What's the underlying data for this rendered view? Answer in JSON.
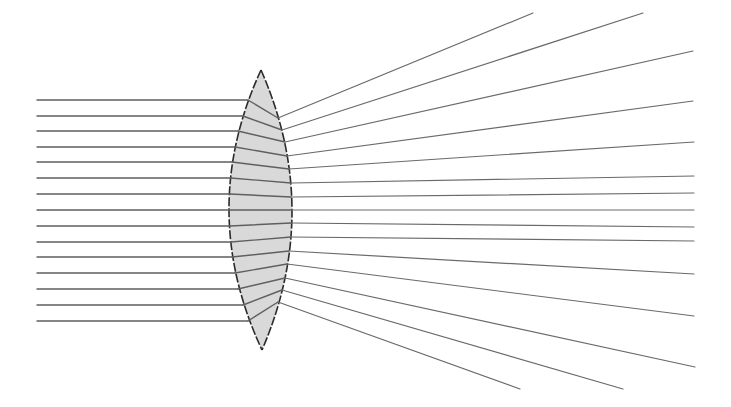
{
  "diagram": {
    "title": "Parallel rays refracted by a biconvex lens showing spherical aberration",
    "colors": {
      "background": "#ffffff",
      "ray": "#5f5f5f",
      "lens_fill": "#d9d9d9",
      "lens_outline": "#2b2b2b"
    },
    "lens": {
      "top_vertex": [
        261,
        70
      ],
      "bottom_vertex": [
        262,
        350
      ],
      "left_surface_apex_x": 229,
      "right_surface_apex_x": 292
    },
    "focus": [
      398,
      210
    ],
    "incoming_ray_start_x": 37,
    "rays": [
      {
        "y": 100,
        "enter_x": 248,
        "exit": [
          278,
          118
        ],
        "end": [
          533,
          13
        ]
      },
      {
        "y": 116,
        "enter_x": 243,
        "exit": [
          282,
          130
        ],
        "end": [
          643,
          13
        ]
      },
      {
        "y": 131,
        "enter_x": 238,
        "exit": [
          285,
          142
        ],
        "end": [
          693,
          51
        ]
      },
      {
        "y": 147,
        "enter_x": 235,
        "exit": [
          287,
          156
        ],
        "end": [
          693,
          101
        ]
      },
      {
        "y": 162,
        "enter_x": 232,
        "exit": [
          289,
          169
        ],
        "end": [
          694,
          142
        ]
      },
      {
        "y": 178,
        "enter_x": 231,
        "exit": [
          291,
          183
        ],
        "end": [
          694,
          176
        ]
      },
      {
        "y": 194,
        "enter_x": 230,
        "exit": [
          291,
          197
        ],
        "end": [
          694,
          193
        ]
      },
      {
        "y": 210,
        "enter_x": 229,
        "exit": [
          292,
          210
        ],
        "end": [
          694,
          210
        ]
      },
      {
        "y": 226,
        "enter_x": 230,
        "exit": [
          291,
          223
        ],
        "end": [
          694,
          227
        ]
      },
      {
        "y": 242,
        "enter_x": 231,
        "exit": [
          291,
          237
        ],
        "end": [
          694,
          241
        ]
      },
      {
        "y": 257,
        "enter_x": 232,
        "exit": [
          289,
          251
        ],
        "end": [
          694,
          274
        ]
      },
      {
        "y": 273,
        "enter_x": 235,
        "exit": [
          287,
          264
        ],
        "end": [
          694,
          316
        ]
      },
      {
        "y": 289,
        "enter_x": 238,
        "exit": [
          285,
          278
        ],
        "end": [
          695,
          367
        ]
      },
      {
        "y": 305,
        "enter_x": 243,
        "exit": [
          282,
          290
        ],
        "end": [
          623,
          389
        ]
      },
      {
        "y": 321,
        "enter_x": 248,
        "exit": [
          278,
          302
        ],
        "end": [
          520,
          389
        ]
      }
    ]
  }
}
